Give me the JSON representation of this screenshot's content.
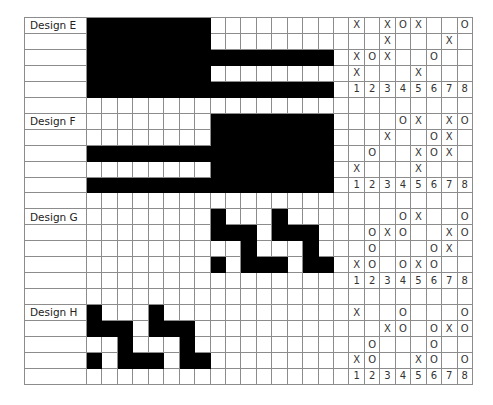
{
  "colors": {
    "fill": "#000000",
    "grid_line": "#8c8c8c",
    "background": "#ffffff",
    "text": "#333333"
  },
  "layout": {
    "pattern_columns": 16,
    "answer_columns": 9,
    "rows_per_design": 5,
    "blank_rows_between": 1
  },
  "designs": [
    {
      "label": "Design E",
      "pattern": [
        "1111111100000000",
        "1111111100000000",
        "1111111111111111",
        "1111111100000000",
        "1111111111111111"
      ],
      "answers": [
        [
          "",
          "X",
          "",
          "X",
          "O",
          "X",
          "",
          "",
          "O"
        ],
        [
          "",
          "",
          "",
          "X",
          "",
          "",
          "",
          "X",
          ""
        ],
        [
          "",
          "X",
          "O",
          "X",
          "",
          "",
          "O",
          "",
          ""
        ],
        [
          "",
          "X",
          "",
          "",
          "",
          "X",
          "",
          "",
          ""
        ],
        [
          "",
          "1",
          "2",
          "3",
          "4",
          "5",
          "6",
          "7",
          "8"
        ]
      ]
    },
    {
      "label": "Design F",
      "pattern": [
        "0000000011111111",
        "0000000011111111",
        "1111111111111111",
        "0000000011111111",
        "1111111111111111"
      ],
      "answers": [
        [
          "",
          "",
          "",
          "",
          "O",
          "X",
          "",
          "X",
          "O"
        ],
        [
          "",
          "",
          "",
          "X",
          "",
          "",
          "O",
          "X",
          ""
        ],
        [
          "",
          "",
          "O",
          "",
          "",
          "X",
          "O",
          "X",
          ""
        ],
        [
          "",
          "X",
          "",
          "",
          "",
          "X",
          "",
          "",
          ""
        ],
        [
          "",
          "1",
          "2",
          "3",
          "4",
          "5",
          "6",
          "7",
          "8"
        ]
      ]
    },
    {
      "label": "Design G",
      "pattern": [
        "0000000010001000",
        "0000000011101110",
        "0000000000100010",
        "0000000010111011",
        "0000000000000000"
      ],
      "answers": [
        [
          "",
          "",
          "",
          "",
          "O",
          "X",
          "",
          "",
          "O"
        ],
        [
          "",
          "",
          "O",
          "X",
          "O",
          "",
          "",
          "X",
          "O"
        ],
        [
          "",
          "",
          "O",
          "",
          "",
          "",
          "O",
          "X",
          ""
        ],
        [
          "",
          "X",
          "O",
          "",
          "O",
          "X",
          "O",
          "",
          ""
        ],
        [
          "",
          "1",
          "2",
          "3",
          "4",
          "5",
          "6",
          "7",
          "8"
        ]
      ]
    },
    {
      "label": "Design H",
      "pattern": [
        "1000100000000000",
        "1110111000000000",
        "0010001000000000",
        "1011101100000000",
        "0000000000000000"
      ],
      "answers": [
        [
          "",
          "X",
          "",
          "",
          "O",
          "",
          "",
          "",
          "O"
        ],
        [
          "",
          "",
          "",
          "X",
          "O",
          "",
          "O",
          "X",
          "O"
        ],
        [
          "",
          "",
          "O",
          "",
          "",
          "",
          "O",
          "",
          ""
        ],
        [
          "",
          "X",
          "O",
          "",
          "",
          "X",
          "O",
          "",
          "O"
        ],
        [
          "",
          "1",
          "2",
          "3",
          "4",
          "5",
          "6",
          "7",
          "8"
        ]
      ]
    }
  ]
}
